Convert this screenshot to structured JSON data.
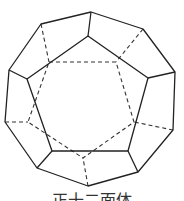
{
  "figure": {
    "caption": "正十二面体",
    "colors": {
      "line": "#222222",
      "background": "#ffffff"
    },
    "outer_decagon": [
      [
        91,
        12
      ],
      [
        143,
        29
      ],
      [
        175,
        72
      ],
      [
        173,
        130
      ],
      [
        138,
        172
      ],
      [
        88,
        186
      ],
      [
        37,
        168
      ],
      [
        5,
        122
      ],
      [
        9,
        70
      ],
      [
        41,
        24
      ]
    ],
    "front_pentagon": [
      [
        88,
        36
      ],
      [
        148,
        78
      ],
      [
        128,
        151
      ],
      [
        52,
        151
      ],
      [
        27,
        79
      ]
    ],
    "front_spokes": [
      [
        [
          91,
          12
        ],
        [
          88,
          36
        ]
      ],
      [
        [
          175,
          72
        ],
        [
          148,
          78
        ]
      ],
      [
        [
          138,
          172
        ],
        [
          128,
          151
        ]
      ],
      [
        [
          37,
          168
        ],
        [
          52,
          151
        ]
      ],
      [
        [
          9,
          70
        ],
        [
          27,
          79
        ]
      ]
    ],
    "back_pentagon": [
      [
        49,
        62
      ],
      [
        116,
        62
      ],
      [
        134,
        122
      ],
      [
        83,
        158
      ],
      [
        28,
        122
      ]
    ],
    "back_spokes": [
      [
        [
          41,
          24
        ],
        [
          49,
          62
        ]
      ],
      [
        [
          143,
          29
        ],
        [
          116,
          62
        ]
      ],
      [
        [
          173,
          130
        ],
        [
          134,
          122
        ]
      ],
      [
        [
          88,
          186
        ],
        [
          83,
          158
        ]
      ],
      [
        [
          5,
          122
        ],
        [
          28,
          122
        ]
      ]
    ]
  }
}
